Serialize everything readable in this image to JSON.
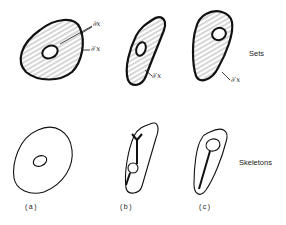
{
  "figure": {
    "row_labels": {
      "sets": "Sets",
      "skeletons": "Skeletons"
    },
    "boundary_labels": {
      "outer_inner": "∂x",
      "outer_prime": "∂′x"
    },
    "captions": [
      "(a)",
      "(b)",
      "(c)"
    ],
    "colors": {
      "ink": "#111111",
      "hatch": "#8a8a8a",
      "background": "#ffffff"
    },
    "columns": [
      {
        "id": "a",
        "caption": "(a)",
        "set_labels": [
          "∂x",
          "∂′x"
        ],
        "skeleton": "closed loop around hole"
      },
      {
        "id": "b",
        "caption": "(b)",
        "set_labels": [
          "∂′x"
        ],
        "skeleton": "forked line through hole"
      },
      {
        "id": "c",
        "caption": "(c)",
        "set_labels": [
          "∂′x"
        ],
        "skeleton": "single line from hole"
      }
    ]
  }
}
